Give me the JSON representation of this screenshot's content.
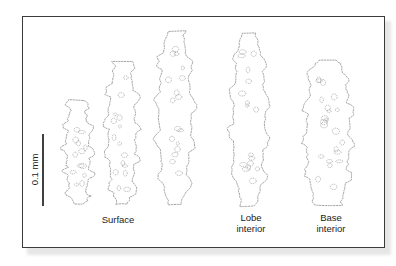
{
  "figure": {
    "scale_bar": {
      "label": "0.1 mm",
      "x": 43,
      "y1": 134,
      "y2": 206
    },
    "sclerites": [
      {
        "id": "surface-1",
        "group": "Surface",
        "cx": 78,
        "top": 100,
        "bottom": 204,
        "half_width": 14
      },
      {
        "id": "surface-2",
        "group": "Surface",
        "cx": 122,
        "top": 62,
        "bottom": 204,
        "half_width": 17
      },
      {
        "id": "surface-3",
        "group": "Surface",
        "cx": 175,
        "top": 31,
        "bottom": 205,
        "half_width": 20
      },
      {
        "id": "lobe-interior-1",
        "group": "Lobe interior",
        "cx": 249,
        "top": 33,
        "bottom": 206,
        "half_width": 20
      },
      {
        "id": "base-interior-1",
        "group": "Base interior",
        "cx": 328,
        "top": 60,
        "bottom": 205,
        "half_width": 27
      }
    ],
    "labels": [
      {
        "text": "Surface",
        "x": 98,
        "y": 214,
        "w": 40
      },
      {
        "text": "Lobe\ninterior",
        "x": 229,
        "y": 212,
        "w": 44
      },
      {
        "text": "Base\ninterior",
        "x": 309,
        "y": 212,
        "w": 44
      }
    ],
    "colors": {
      "outline": "#6a6a6a",
      "frame": "#3a3a3a",
      "scale_bar": "#111111",
      "text": "#222222"
    }
  }
}
